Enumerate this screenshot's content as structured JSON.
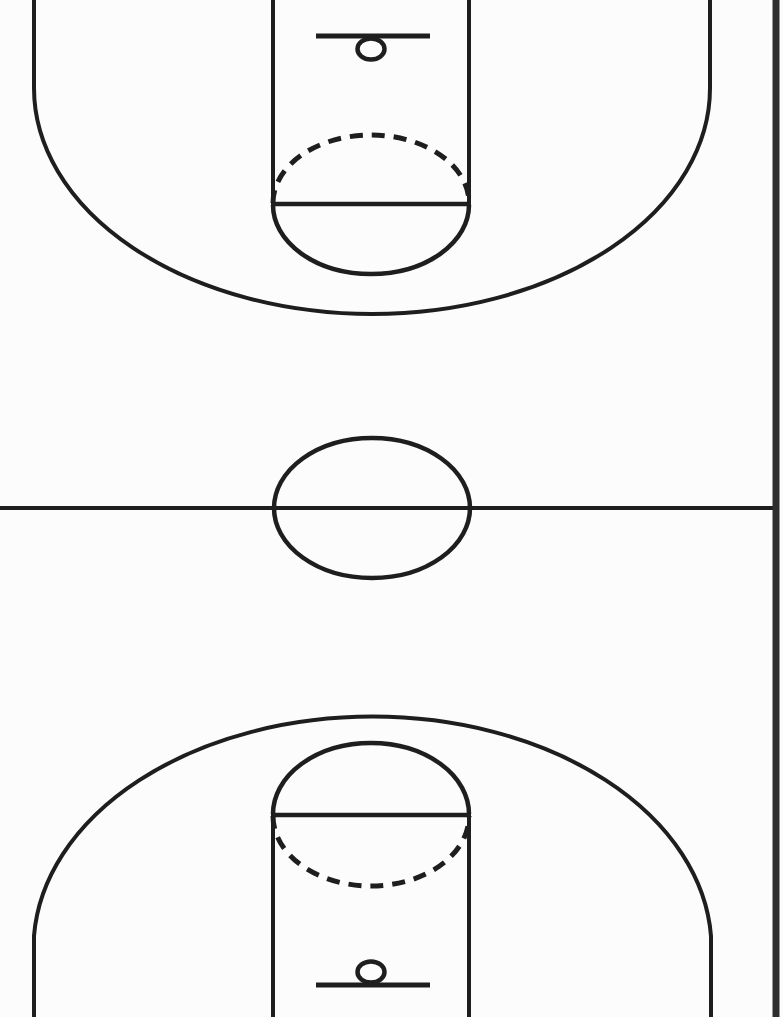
{
  "diagram": {
    "type": "basketball-court-full-court-diagram",
    "canvas": {
      "width": 783,
      "height": 1017
    },
    "colors": {
      "background": "#fcfcfc",
      "court_line": "#1e1e1e",
      "page_edge": "#2e2e2e"
    },
    "shapes": [
      {
        "name": "page-background",
        "tag": "rect",
        "attrs": {
          "x": 0,
          "y": 0,
          "width": 783,
          "height": 1017,
          "fill": "#fcfcfc",
          "stroke": "none"
        }
      },
      {
        "name": "top-three-point-line",
        "tag": "path",
        "attrs": {
          "d": "M 34 0 L 34 88 A 338 226 0 0 0 710 88 L 710 0",
          "fill": "none",
          "stroke": "#1e1e1e",
          "stroke-width": 4
        }
      },
      {
        "name": "top-lane-left-line",
        "tag": "line",
        "attrs": {
          "x1": 273,
          "y1": 0,
          "x2": 273,
          "y2": 203,
          "stroke": "#1e1e1e",
          "stroke-width": 4
        }
      },
      {
        "name": "top-lane-right-line",
        "tag": "line",
        "attrs": {
          "x1": 469,
          "y1": 0,
          "x2": 469,
          "y2": 203,
          "stroke": "#1e1e1e",
          "stroke-width": 4
        }
      },
      {
        "name": "top-backboard-line",
        "tag": "line",
        "attrs": {
          "x1": 316,
          "y1": 36,
          "x2": 430,
          "y2": 36,
          "stroke": "#1e1e1e",
          "stroke-width": 5
        }
      },
      {
        "name": "top-hoop-circle",
        "tag": "ellipse",
        "attrs": {
          "cx": 371,
          "cy": 49,
          "rx": 13.5,
          "ry": 10.5,
          "fill": "none",
          "stroke": "#1e1e1e",
          "stroke-width": 4.5
        }
      },
      {
        "name": "top-free-throw-circle-dashed-half",
        "tag": "path",
        "attrs": {
          "d": "M 273 203 A 98 68 0 0 1 469 203",
          "fill": "none",
          "stroke": "#1e1e1e",
          "stroke-width": 5,
          "stroke-dasharray": "13 9"
        }
      },
      {
        "name": "top-free-throw-line",
        "tag": "line",
        "attrs": {
          "x1": 271,
          "y1": 204,
          "x2": 471,
          "y2": 204,
          "stroke": "#1e1e1e",
          "stroke-width": 4.5
        }
      },
      {
        "name": "top-free-throw-circle-solid-half",
        "tag": "path",
        "attrs": {
          "d": "M 273 205 A 98 69 0 0 0 469 205",
          "fill": "none",
          "stroke": "#1e1e1e",
          "stroke-width": 4.5
        }
      },
      {
        "name": "half-court-line",
        "tag": "line",
        "attrs": {
          "x1": 0,
          "y1": 508,
          "x2": 776,
          "y2": 508,
          "stroke": "#1e1e1e",
          "stroke-width": 4
        }
      },
      {
        "name": "center-circle",
        "tag": "ellipse",
        "attrs": {
          "cx": 372,
          "cy": 508,
          "rx": 98,
          "ry": 70,
          "fill": "none",
          "stroke": "#1e1e1e",
          "stroke-width": 4.5
        }
      },
      {
        "name": "bottom-three-point-line",
        "tag": "path",
        "attrs": {
          "d": "M 34 1017 L 34 936 A 339 232 0 0 1 711 936 L 711 1017",
          "fill": "none",
          "stroke": "#1e1e1e",
          "stroke-width": 4
        }
      },
      {
        "name": "bottom-free-throw-circle-solid-half",
        "tag": "path",
        "attrs": {
          "d": "M 273 814 A 98 71 0 0 1 469 814",
          "fill": "none",
          "stroke": "#1e1e1e",
          "stroke-width": 4.5
        }
      },
      {
        "name": "bottom-free-throw-line",
        "tag": "line",
        "attrs": {
          "x1": 271,
          "y1": 815,
          "x2": 471,
          "y2": 815,
          "stroke": "#1e1e1e",
          "stroke-width": 4.5
        }
      },
      {
        "name": "bottom-free-throw-circle-dashed-half",
        "tag": "path",
        "attrs": {
          "d": "M 273 816 A 98 70 0 0 0 469 816",
          "fill": "none",
          "stroke": "#1e1e1e",
          "stroke-width": 5,
          "stroke-dasharray": "13 9"
        }
      },
      {
        "name": "bottom-lane-left-line",
        "tag": "line",
        "attrs": {
          "x1": 273,
          "y1": 816,
          "x2": 273,
          "y2": 1017,
          "stroke": "#1e1e1e",
          "stroke-width": 4
        }
      },
      {
        "name": "bottom-lane-right-line",
        "tag": "line",
        "attrs": {
          "x1": 469,
          "y1": 816,
          "x2": 469,
          "y2": 1017,
          "stroke": "#1e1e1e",
          "stroke-width": 4
        }
      },
      {
        "name": "bottom-hoop-circle",
        "tag": "ellipse",
        "attrs": {
          "cx": 371,
          "cy": 972,
          "rx": 13.5,
          "ry": 10.5,
          "fill": "none",
          "stroke": "#1e1e1e",
          "stroke-width": 4.5
        }
      },
      {
        "name": "bottom-backboard-line",
        "tag": "line",
        "attrs": {
          "x1": 316,
          "y1": 985,
          "x2": 430,
          "y2": 985,
          "stroke": "#1e1e1e",
          "stroke-width": 5
        }
      },
      {
        "name": "page-edge-line",
        "tag": "line",
        "attrs": {
          "x1": 776,
          "y1": 0,
          "x2": 776,
          "y2": 1017,
          "stroke": "#2e2e2e",
          "stroke-width": 7
        }
      }
    ]
  }
}
